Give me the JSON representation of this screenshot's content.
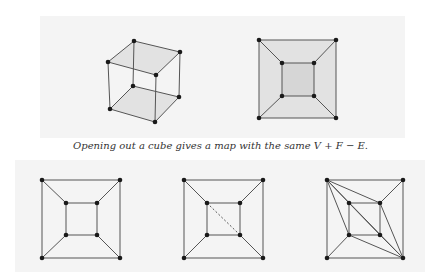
{
  "caption": "Opening out a cube gives a map with the same V + F − E.",
  "colors": {
    "edge": "#555555",
    "vertex": "#1a1a1a",
    "face_shade": "#e2e2e2",
    "inner_face_shade": "#d6d6d6",
    "background_speckle": "#f3f3f3"
  },
  "figures": [
    {
      "name": "cube",
      "vertices": [
        [
          134,
          41
        ],
        [
          180,
          52
        ],
        [
          108,
          62
        ],
        [
          156,
          75
        ],
        [
          133,
          86
        ],
        [
          179,
          97
        ],
        [
          110,
          109
        ],
        [
          155,
          122
        ]
      ],
      "edges": [
        [
          0,
          1
        ],
        [
          0,
          2
        ],
        [
          1,
          3
        ],
        [
          2,
          3
        ],
        [
          4,
          5
        ],
        [
          4,
          6
        ],
        [
          5,
          7
        ],
        [
          6,
          7
        ],
        [
          0,
          4
        ],
        [
          1,
          5
        ],
        [
          2,
          6
        ],
        [
          3,
          7
        ]
      ],
      "shaded_faces": [
        [
          0,
          1,
          3,
          2
        ],
        [
          4,
          5,
          7,
          6
        ]
      ],
      "dashed_edges": []
    },
    {
      "name": "cube-map",
      "vertices": [
        [
          259,
          40
        ],
        [
          336,
          40
        ],
        [
          336,
          118
        ],
        [
          259,
          118
        ],
        [
          282,
          63
        ],
        [
          314,
          63
        ],
        [
          314,
          96
        ],
        [
          282,
          96
        ]
      ],
      "edges": [
        [
          0,
          1
        ],
        [
          1,
          2
        ],
        [
          2,
          3
        ],
        [
          3,
          0
        ],
        [
          4,
          5
        ],
        [
          5,
          6
        ],
        [
          6,
          7
        ],
        [
          7,
          4
        ],
        [
          0,
          4
        ],
        [
          1,
          5
        ],
        [
          2,
          6
        ],
        [
          3,
          7
        ]
      ],
      "shaded_faces": [
        [
          0,
          1,
          2,
          3
        ]
      ],
      "inner_shaded": [
        [
          4,
          5,
          6,
          7
        ]
      ],
      "dashed_edges": []
    },
    {
      "name": "planar-graph",
      "vertices": [
        [
          42,
          180
        ],
        [
          120,
          180
        ],
        [
          120,
          258
        ],
        [
          42,
          258
        ],
        [
          66,
          203
        ],
        [
          97,
          203
        ],
        [
          97,
          235
        ],
        [
          66,
          235
        ]
      ],
      "edges": [
        [
          0,
          1
        ],
        [
          1,
          2
        ],
        [
          2,
          3
        ],
        [
          3,
          0
        ],
        [
          4,
          5
        ],
        [
          5,
          6
        ],
        [
          6,
          7
        ],
        [
          7,
          4
        ],
        [
          0,
          4
        ],
        [
          1,
          5
        ],
        [
          2,
          6
        ],
        [
          3,
          7
        ]
      ],
      "dashed_edges": []
    },
    {
      "name": "planar-graph-with-diagonal",
      "vertices": [
        [
          184,
          180
        ],
        [
          263,
          180
        ],
        [
          263,
          258
        ],
        [
          184,
          258
        ],
        [
          207,
          203
        ],
        [
          240,
          203
        ],
        [
          240,
          235
        ],
        [
          207,
          235
        ]
      ],
      "edges": [
        [
          0,
          1
        ],
        [
          1,
          2
        ],
        [
          2,
          3
        ],
        [
          3,
          0
        ],
        [
          4,
          5
        ],
        [
          5,
          6
        ],
        [
          6,
          7
        ],
        [
          7,
          4
        ],
        [
          0,
          4
        ],
        [
          1,
          5
        ],
        [
          2,
          6
        ],
        [
          3,
          7
        ]
      ],
      "dashed_edges": [
        [
          4,
          6
        ]
      ]
    },
    {
      "name": "triangulated-graph",
      "vertices": [
        [
          327,
          180
        ],
        [
          403,
          180
        ],
        [
          403,
          258
        ],
        [
          327,
          258
        ],
        [
          349,
          203
        ],
        [
          380,
          203
        ],
        [
          380,
          235
        ],
        [
          349,
          235
        ]
      ],
      "edges": [
        [
          0,
          1
        ],
        [
          1,
          2
        ],
        [
          2,
          3
        ],
        [
          3,
          0
        ],
        [
          4,
          5
        ],
        [
          5,
          6
        ],
        [
          6,
          7
        ],
        [
          7,
          4
        ],
        [
          0,
          7
        ],
        [
          1,
          5
        ],
        [
          2,
          6
        ],
        [
          3,
          7
        ],
        [
          0,
          4
        ],
        [
          0,
          5
        ],
        [
          4,
          6
        ],
        [
          2,
          5
        ],
        [
          2,
          7
        ],
        [
          0,
          2
        ]
      ],
      "dashed_edges": []
    }
  ]
}
